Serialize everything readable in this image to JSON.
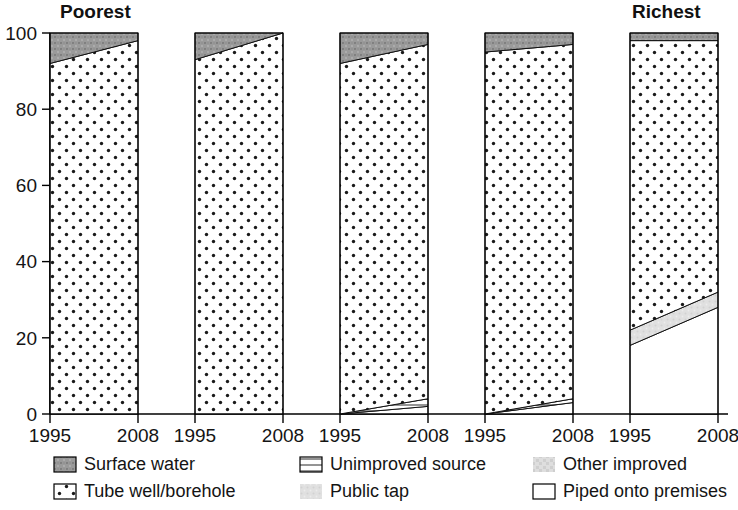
{
  "chart_data": {
    "type": "area",
    "title": "",
    "subtitle": "",
    "xlabel": "",
    "ylabel": "",
    "ylim": [
      0,
      100
    ],
    "grid": false,
    "legend_position": "bottom",
    "x": [
      "1995",
      "2008"
    ],
    "panels": [
      {
        "label": "Poorest",
        "tick_labels": [
          "1995",
          "2008"
        ],
        "series": [
          {
            "name": "Piped onto premises",
            "values": [
              0,
              0
            ]
          },
          {
            "name": "Public tap",
            "values": [
              0,
              0
            ]
          },
          {
            "name": "Other improved",
            "values": [
              0,
              0
            ]
          },
          {
            "name": "Unimproved source",
            "values": [
              0,
              0
            ]
          },
          {
            "name": "Tube well/borehole",
            "values": [
              92,
              98
            ]
          },
          {
            "name": "Surface water",
            "values": [
              8,
              2
            ]
          }
        ]
      },
      {
        "label": "",
        "tick_labels": [
          "1995",
          "2008"
        ],
        "series": [
          {
            "name": "Piped onto premises",
            "values": [
              0,
              0
            ]
          },
          {
            "name": "Public tap",
            "values": [
              0,
              0
            ]
          },
          {
            "name": "Other improved",
            "values": [
              0,
              0
            ]
          },
          {
            "name": "Unimproved source",
            "values": [
              0,
              0
            ]
          },
          {
            "name": "Tube well/borehole",
            "values": [
              93,
              100
            ]
          },
          {
            "name": "Surface water",
            "values": [
              7,
              0
            ]
          }
        ]
      },
      {
        "label": "",
        "tick_labels": [
          "1995",
          "2008"
        ],
        "series": [
          {
            "name": "Piped onto premises",
            "values": [
              0,
              2
            ]
          },
          {
            "name": "Public tap",
            "values": [
              0,
              0
            ]
          },
          {
            "name": "Other improved",
            "values": [
              0,
              0
            ]
          },
          {
            "name": "Unimproved source",
            "values": [
              0,
              2
            ]
          },
          {
            "name": "Tube well/borehole",
            "values": [
              92,
              93
            ]
          },
          {
            "name": "Surface water",
            "values": [
              8,
              3
            ]
          }
        ]
      },
      {
        "label": "",
        "tick_labels": [
          "1995",
          "2008"
        ],
        "series": [
          {
            "name": "Piped onto premises",
            "values": [
              0,
              3
            ]
          },
          {
            "name": "Public tap",
            "values": [
              0,
              0
            ]
          },
          {
            "name": "Other improved",
            "values": [
              0,
              0
            ]
          },
          {
            "name": "Unimproved source",
            "values": [
              0,
              1
            ]
          },
          {
            "name": "Tube well/borehole",
            "values": [
              95,
              93
            ]
          },
          {
            "name": "Surface water",
            "values": [
              5,
              3
            ]
          }
        ]
      },
      {
        "label": "Richest",
        "tick_labels": [
          "1995",
          "2008"
        ],
        "series": [
          {
            "name": "Piped onto premises",
            "values": [
              18,
              28
            ]
          },
          {
            "name": "Public tap",
            "values": [
              4,
              4
            ]
          },
          {
            "name": "Other improved",
            "values": [
              0,
              0
            ]
          },
          {
            "name": "Unimproved source",
            "values": [
              0,
              0
            ]
          },
          {
            "name": "Tube well/borehole",
            "values": [
              76,
              66
            ]
          },
          {
            "name": "Surface water",
            "values": [
              2,
              2
            ]
          }
        ]
      }
    ],
    "y_ticks": [
      "0",
      "20",
      "40",
      "60",
      "80",
      "100"
    ],
    "legend": [
      {
        "label": "Surface water",
        "pattern": "dark-gray-speckle",
        "color": "#8c8c8c"
      },
      {
        "label": "Unimproved source",
        "pattern": "horizontal-lines",
        "color": "#ffffff"
      },
      {
        "label": "Other improved",
        "pattern": "light-gray-speckle",
        "color": "#d4d4d4"
      },
      {
        "label": "Tube well/borehole",
        "pattern": "dots",
        "color": "#ffffff"
      },
      {
        "label": "Public tap",
        "pattern": "very-light-gray",
        "color": "#e3e3e3"
      },
      {
        "label": "Piped onto premises",
        "pattern": "solid-white",
        "color": "#ffffff"
      }
    ]
  }
}
